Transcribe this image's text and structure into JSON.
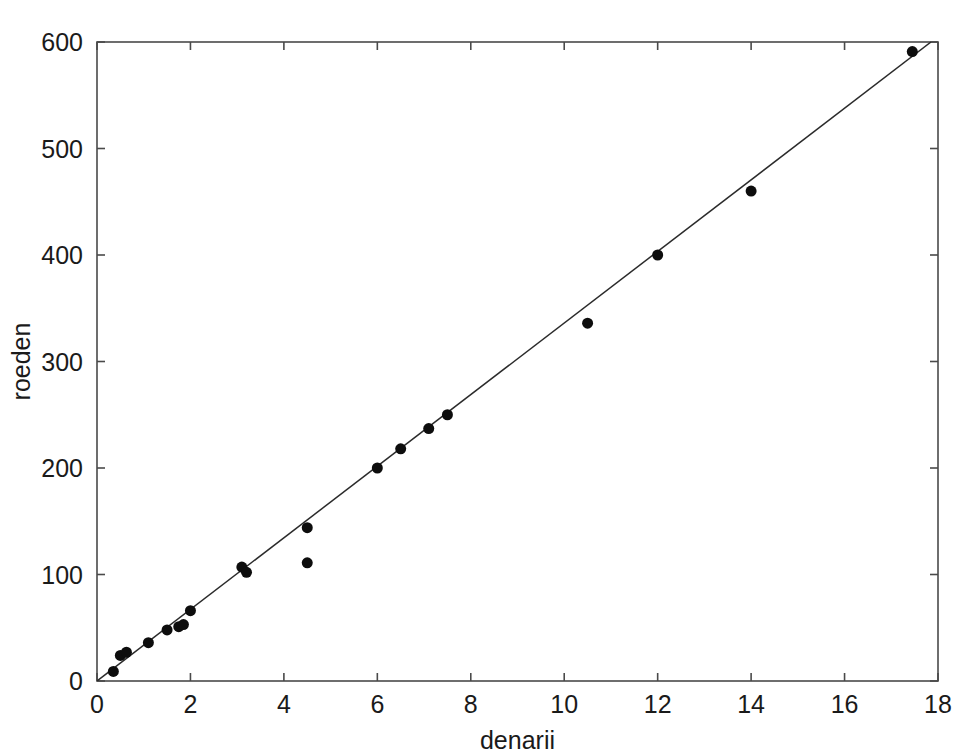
{
  "chart_data": {
    "type": "scatter",
    "title": "",
    "xlabel": "denarii",
    "ylabel": "roeden",
    "xlim": [
      0,
      18
    ],
    "ylim": [
      0,
      600
    ],
    "xticks": [
      0,
      2,
      4,
      6,
      8,
      10,
      12,
      14,
      16,
      18
    ],
    "yticks": [
      0,
      100,
      200,
      300,
      400,
      500,
      600
    ],
    "xticklabels": [
      "0",
      "2",
      "4",
      "6",
      "8",
      "10",
      "12",
      "14",
      "16",
      "18"
    ],
    "yticklabels": [
      "0",
      "100",
      "200",
      "300",
      "400",
      "500",
      "600"
    ],
    "grid": false,
    "legend": false,
    "marker": "filled-circle",
    "marker_color": "#0d0d0d",
    "marker_size": 11,
    "points": [
      {
        "x": 0.35,
        "y": 9
      },
      {
        "x": 0.5,
        "y": 24
      },
      {
        "x": 0.63,
        "y": 27
      },
      {
        "x": 1.1,
        "y": 36
      },
      {
        "x": 1.5,
        "y": 48
      },
      {
        "x": 1.75,
        "y": 51
      },
      {
        "x": 1.85,
        "y": 53
      },
      {
        "x": 2.0,
        "y": 66
      },
      {
        "x": 3.1,
        "y": 107
      },
      {
        "x": 3.2,
        "y": 102
      },
      {
        "x": 4.5,
        "y": 144
      },
      {
        "x": 4.5,
        "y": 111
      },
      {
        "x": 6.0,
        "y": 200
      },
      {
        "x": 6.5,
        "y": 218
      },
      {
        "x": 7.1,
        "y": 237
      },
      {
        "x": 7.5,
        "y": 250
      },
      {
        "x": 10.5,
        "y": 336
      },
      {
        "x": 12.0,
        "y": 400
      },
      {
        "x": 14.0,
        "y": 460
      },
      {
        "x": 17.45,
        "y": 591
      }
    ],
    "fit_line": {
      "type": "linear",
      "x_start": 0,
      "y_start": 0,
      "x_end": 17.85,
      "y_end": 600,
      "color": "#2b2b2b"
    }
  }
}
